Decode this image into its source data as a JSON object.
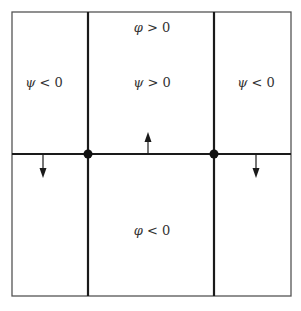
{
  "diagram": {
    "type": "region-partition",
    "outer_box": {
      "x1": 12,
      "y1": 12,
      "x2": 291,
      "y2": 296,
      "color": "#555555"
    },
    "boundary_color": "#1a1a1a",
    "vertical_lines": [
      {
        "x": 88
      },
      {
        "x": 214
      }
    ],
    "horizontal_line": {
      "y": 154
    },
    "nodes": [
      {
        "x": 88,
        "y": 154
      },
      {
        "x": 214,
        "y": 154
      }
    ],
    "arrows": [
      {
        "name": "arrow-up-center",
        "x": 148,
        "from_y": 154,
        "to_y": 132,
        "direction": "up"
      },
      {
        "name": "arrow-down-left",
        "x": 43,
        "from_y": 154,
        "to_y": 178,
        "direction": "down"
      },
      {
        "name": "arrow-down-right",
        "x": 256,
        "from_y": 154,
        "to_y": 178,
        "direction": "down"
      }
    ],
    "labels": {
      "phi_pos": {
        "symbol": "φ",
        "relation": " > 0",
        "x": 152,
        "y": 27
      },
      "psi_pos": {
        "symbol": "ψ",
        "relation": " > 0",
        "x": 152,
        "y": 82
      },
      "psi_neg_left": {
        "symbol": "ψ",
        "relation": " < 0",
        "x": 44,
        "y": 82
      },
      "psi_neg_right": {
        "symbol": "ψ",
        "relation": " < 0",
        "x": 256,
        "y": 82
      },
      "phi_neg": {
        "symbol": "φ",
        "relation": " < 0",
        "x": 152,
        "y": 230
      }
    }
  }
}
